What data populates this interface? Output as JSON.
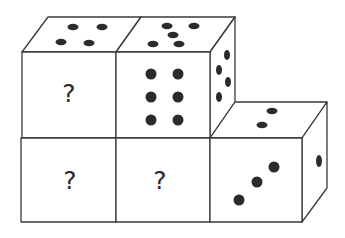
{
  "puzzle": {
    "description": "Stacked dice arrangement with unknown faces",
    "unknown_symbol": "?",
    "dice": [
      {
        "id": "top-left",
        "front": "?",
        "top": 4
      },
      {
        "id": "top-middle",
        "front": 6,
        "top": 5,
        "right": 4
      },
      {
        "id": "bottom-left",
        "front": "?"
      },
      {
        "id": "bottom-middle",
        "front": "?"
      },
      {
        "id": "bottom-right",
        "front": 3,
        "top": 2,
        "right": 1
      }
    ]
  },
  "colors": {
    "line": "#3a3a3a",
    "pip": "#2b2b2b",
    "background": "#ffffff"
  }
}
